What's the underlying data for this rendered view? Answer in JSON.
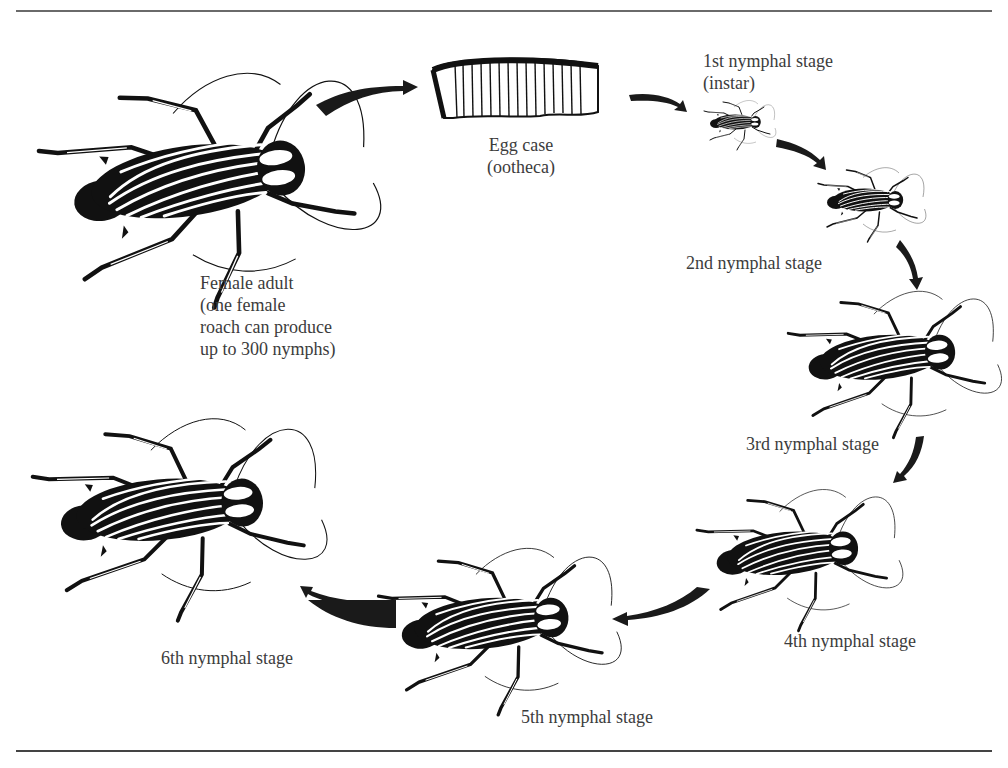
{
  "diagram": {
    "stages": [
      {
        "id": "female-adult",
        "lines": [
          "Female adult",
          "(one female",
          "roach can produce",
          "up to 300 nymphs)"
        ]
      },
      {
        "id": "egg-case",
        "lines": [
          "Egg case",
          "(ootheca)"
        ]
      },
      {
        "id": "nymph-1",
        "lines": [
          "1st nymphal stage",
          "(instar)"
        ]
      },
      {
        "id": "nymph-2",
        "lines": [
          "2nd nymphal stage"
        ]
      },
      {
        "id": "nymph-3",
        "lines": [
          "3rd nymphal stage"
        ]
      },
      {
        "id": "nymph-4",
        "lines": [
          "4th nymphal stage"
        ]
      },
      {
        "id": "nymph-5",
        "lines": [
          "5th nymphal stage"
        ]
      },
      {
        "id": "nymph-6",
        "lines": [
          "6th nymphal stage"
        ]
      }
    ],
    "flow": [
      {
        "from": "female-adult",
        "to": "egg-case"
      },
      {
        "from": "egg-case",
        "to": "nymph-1"
      },
      {
        "from": "nymph-1",
        "to": "nymph-2"
      },
      {
        "from": "nymph-2",
        "to": "nymph-3"
      },
      {
        "from": "nymph-3",
        "to": "nymph-4"
      },
      {
        "from": "nymph-4",
        "to": "nymph-5"
      },
      {
        "from": "nymph-5",
        "to": "nymph-6"
      }
    ],
    "colors": {
      "ink": "#111111",
      "text": "#3c3c3c",
      "rule": "#555555",
      "background": "#ffffff"
    }
  }
}
